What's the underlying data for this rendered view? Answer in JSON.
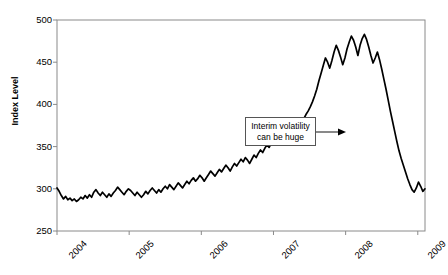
{
  "chart_data": {
    "type": "line",
    "title": "",
    "xlabel": "",
    "ylabel": "Index Level",
    "xlim": [
      2004.0,
      2009.1
    ],
    "ylim": [
      250,
      500
    ],
    "yticks": [
      250,
      300,
      350,
      400,
      450,
      500
    ],
    "xticks": [
      "2004",
      "2005",
      "2006",
      "2007",
      "2008",
      "2009"
    ],
    "grid": false,
    "legend": "none",
    "line_color": "#000000",
    "annotations": [
      {
        "text_line1": "Interim volatility",
        "text_line2": "can be huge",
        "arrow": "right"
      }
    ],
    "series": [
      {
        "name": "Index Level",
        "x": [
          2004.0,
          2004.03,
          2004.06,
          2004.09,
          2004.12,
          2004.15,
          2004.18,
          2004.21,
          2004.24,
          2004.27,
          2004.3,
          2004.33,
          2004.36,
          2004.39,
          2004.42,
          2004.45,
          2004.48,
          2004.51,
          2004.54,
          2004.57,
          2004.6,
          2004.63,
          2004.66,
          2004.69,
          2004.72,
          2004.75,
          2004.78,
          2004.81,
          2004.84,
          2004.87,
          2004.9,
          2004.93,
          2004.96,
          2004.99,
          2005.02,
          2005.05,
          2005.08,
          2005.11,
          2005.14,
          2005.17,
          2005.2,
          2005.23,
          2005.26,
          2005.29,
          2005.32,
          2005.35,
          2005.38,
          2005.41,
          2005.44,
          2005.47,
          2005.5,
          2005.53,
          2005.56,
          2005.59,
          2005.62,
          2005.65,
          2005.68,
          2005.71,
          2005.74,
          2005.77,
          2005.8,
          2005.83,
          2005.86,
          2005.89,
          2005.92,
          2005.95,
          2005.98,
          2006.01,
          2006.04,
          2006.07,
          2006.1,
          2006.13,
          2006.16,
          2006.19,
          2006.22,
          2006.25,
          2006.28,
          2006.31,
          2006.34,
          2006.37,
          2006.4,
          2006.43,
          2006.46,
          2006.49,
          2006.52,
          2006.55,
          2006.58,
          2006.61,
          2006.64,
          2006.67,
          2006.7,
          2006.73,
          2006.76,
          2006.79,
          2006.82,
          2006.85,
          2006.88,
          2006.91,
          2006.94,
          2006.97,
          2007.0,
          2007.03,
          2007.06,
          2007.09,
          2007.12,
          2007.15,
          2007.18,
          2007.21,
          2007.24,
          2007.27,
          2007.3,
          2007.33,
          2007.36,
          2007.39,
          2007.42,
          2007.45,
          2007.48,
          2007.51,
          2007.54,
          2007.57,
          2007.6,
          2007.63,
          2007.66,
          2007.69,
          2007.72,
          2007.75,
          2007.78,
          2007.81,
          2007.84,
          2007.87,
          2007.9,
          2007.93,
          2007.96,
          2007.99,
          2008.02,
          2008.05,
          2008.08,
          2008.11,
          2008.14,
          2008.17,
          2008.2,
          2008.23,
          2008.26,
          2008.29,
          2008.32,
          2008.35,
          2008.38,
          2008.41,
          2008.44,
          2008.47,
          2008.5,
          2008.53,
          2008.56,
          2008.59,
          2008.62,
          2008.65,
          2008.68,
          2008.71,
          2008.74,
          2008.77,
          2008.8,
          2008.83,
          2008.86,
          2008.89,
          2008.92,
          2008.95,
          2008.98,
          2009.01,
          2009.04,
          2009.07,
          2009.1
        ],
        "values": [
          301,
          297,
          292,
          288,
          291,
          287,
          289,
          286,
          288,
          285,
          287,
          290,
          288,
          292,
          289,
          293,
          290,
          296,
          299,
          295,
          292,
          296,
          293,
          290,
          294,
          291,
          295,
          298,
          302,
          299,
          296,
          293,
          297,
          300,
          298,
          295,
          292,
          296,
          293,
          290,
          293,
          297,
          294,
          298,
          301,
          298,
          295,
          299,
          296,
          300,
          303,
          300,
          305,
          302,
          299,
          303,
          307,
          304,
          301,
          305,
          309,
          306,
          310,
          313,
          309,
          312,
          316,
          313,
          309,
          313,
          317,
          321,
          318,
          315,
          319,
          323,
          320,
          324,
          328,
          325,
          321,
          326,
          330,
          327,
          331,
          335,
          332,
          337,
          334,
          330,
          335,
          340,
          337,
          342,
          346,
          343,
          348,
          352,
          349,
          354,
          358,
          355,
          360,
          364,
          361,
          366,
          370,
          367,
          363,
          368,
          372,
          377,
          381,
          378,
          383,
          388,
          392,
          397,
          403,
          410,
          418,
          428,
          437,
          446,
          455,
          450,
          443,
          452,
          462,
          470,
          464,
          456,
          447,
          455,
          466,
          474,
          481,
          476,
          468,
          458,
          470,
          478,
          483,
          477,
          468,
          458,
          449,
          455,
          462,
          453,
          442,
          430,
          418,
          405,
          392,
          380,
          368,
          356,
          345,
          336,
          328,
          320,
          312,
          305,
          299,
          296,
          301,
          308,
          303,
          297,
          300
        ]
      }
    ]
  },
  "axis": {
    "y_title": "Index Level",
    "ytick_labels": [
      "500",
      "450",
      "400",
      "350",
      "300",
      "250"
    ],
    "xtick_labels": [
      "2004",
      "2005",
      "2006",
      "2007",
      "2008",
      "2009"
    ]
  },
  "annotation": {
    "line1": "Interim volatility",
    "line2": "can be huge"
  }
}
